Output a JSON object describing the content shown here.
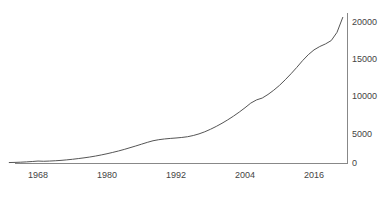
{
  "chart_data": {
    "type": "line",
    "title": "",
    "subtitle": "",
    "xlabel": "",
    "ylabel": "",
    "xlim": [
      1963,
      2022
    ],
    "ylim": [
      0,
      21500
    ],
    "grid": false,
    "legend": null,
    "legend_position": "none",
    "xticks": [
      "1968",
      "1980",
      "1992",
      "2004",
      "2016"
    ],
    "xtick_values": [
      1968,
      1980,
      1992,
      2004,
      2016
    ],
    "yticks": [
      "0",
      "5000",
      "10000",
      "15000",
      "20000"
    ],
    "ytick_values": [
      0,
      5000,
      10000,
      15000,
      20000
    ],
    "yaxis_side": "right",
    "xaxis_side": "bottom",
    "line_color": "#555555",
    "axis_color": "#888888",
    "background_color": "#ffffff",
    "series": [
      {
        "name": "series-1",
        "x": [
          1963,
          1964,
          1965,
          1966,
          1967,
          1968,
          1969,
          1970,
          1971,
          1972,
          1973,
          1974,
          1975,
          1976,
          1977,
          1978,
          1979,
          1980,
          1981,
          1982,
          1983,
          1984,
          1985,
          1986,
          1987,
          1988,
          1989,
          1990,
          1991,
          1992,
          1993,
          1994,
          1995,
          1996,
          1997,
          1998,
          1999,
          2000,
          2001,
          2002,
          2003,
          2004,
          2005,
          2006,
          2007,
          2008,
          2009,
          2010,
          2011,
          2012,
          2013,
          2014,
          2015,
          2016,
          2017,
          2018,
          2019,
          2020,
          2021
        ],
        "values": [
          60,
          80,
          110,
          150,
          200,
          260,
          230,
          260,
          300,
          350,
          420,
          500,
          590,
          690,
          800,
          930,
          1080,
          1240,
          1420,
          1610,
          1820,
          2050,
          2280,
          2520,
          2760,
          2980,
          3120,
          3220,
          3290,
          3350,
          3420,
          3520,
          3680,
          3900,
          4180,
          4520,
          4900,
          5320,
          5780,
          6280,
          6820,
          7400,
          8020,
          8450,
          8700,
          9180,
          9750,
          10400,
          11150,
          11950,
          12800,
          13700,
          14500,
          15150,
          15600,
          15950,
          16400,
          17500,
          19500
        ]
      }
    ]
  },
  "axes": {
    "y_axis_name": "y-axis",
    "x_axis_name": "x-axis"
  }
}
